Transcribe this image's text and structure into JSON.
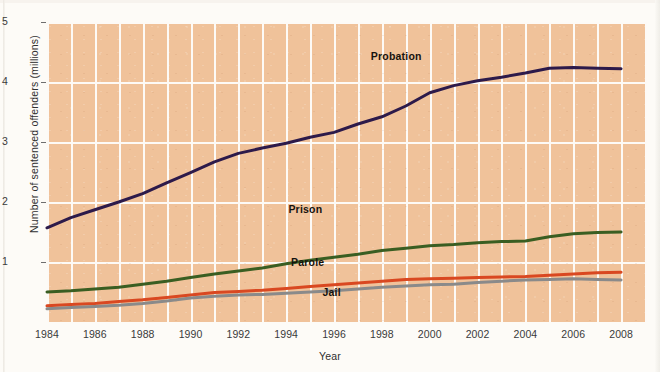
{
  "chart_data": {
    "type": "line",
    "title": "",
    "xlabel": "Year",
    "ylabel": "Number of sentenced offenders (millions)",
    "xlim": [
      1984,
      2009
    ],
    "ylim": [
      0,
      5
    ],
    "grid": true,
    "legend_position": "inline-annotations",
    "x_tick_labels": [
      "1984",
      "1986",
      "1988",
      "1990",
      "1992",
      "1994",
      "1996",
      "1998",
      "2000",
      "2002",
      "2004",
      "2006",
      "2008"
    ],
    "y_tick_labels": [
      "1",
      "2",
      "3",
      "4",
      "5"
    ],
    "x": [
      1984,
      1985,
      1986,
      1987,
      1988,
      1989,
      1990,
      1991,
      1992,
      1993,
      1994,
      1995,
      1996,
      1997,
      1998,
      1999,
      2000,
      2001,
      2002,
      2003,
      2004,
      2005,
      2006,
      2007,
      2008
    ],
    "series": [
      {
        "name": "Probation",
        "color": "#2d1a4a",
        "label_x": 1998.6,
        "label_y": 4.42,
        "values": [
          1.57,
          1.74,
          1.87,
          2.0,
          2.14,
          2.32,
          2.49,
          2.67,
          2.81,
          2.9,
          2.98,
          3.08,
          3.16,
          3.3,
          3.42,
          3.6,
          3.82,
          3.94,
          4.02,
          4.08,
          4.15,
          4.23,
          4.24,
          4.23,
          4.22
        ]
      },
      {
        "name": "Prison",
        "color": "#3a5e22",
        "label_x": 1994.8,
        "label_y": 1.86,
        "values": [
          0.5,
          0.52,
          0.55,
          0.58,
          0.63,
          0.68,
          0.74,
          0.8,
          0.85,
          0.9,
          0.97,
          1.03,
          1.08,
          1.13,
          1.19,
          1.23,
          1.27,
          1.29,
          1.32,
          1.34,
          1.35,
          1.42,
          1.47,
          1.49,
          1.5
        ]
      },
      {
        "name": "Parole",
        "color": "#d94821",
        "label_x": 1994.9,
        "label_y": 0.98,
        "values": [
          0.27,
          0.29,
          0.31,
          0.34,
          0.37,
          0.41,
          0.45,
          0.49,
          0.51,
          0.53,
          0.56,
          0.59,
          0.62,
          0.65,
          0.68,
          0.71,
          0.72,
          0.73,
          0.74,
          0.75,
          0.76,
          0.78,
          0.8,
          0.82,
          0.83
        ]
      },
      {
        "name": "Jail",
        "color": "#8a8a8a",
        "label_x": 1995.9,
        "label_y": 0.48,
        "values": [
          0.22,
          0.24,
          0.26,
          0.28,
          0.31,
          0.35,
          0.4,
          0.43,
          0.45,
          0.46,
          0.48,
          0.5,
          0.52,
          0.55,
          0.58,
          0.6,
          0.62,
          0.63,
          0.66,
          0.68,
          0.7,
          0.71,
          0.72,
          0.71,
          0.7
        ]
      }
    ]
  }
}
